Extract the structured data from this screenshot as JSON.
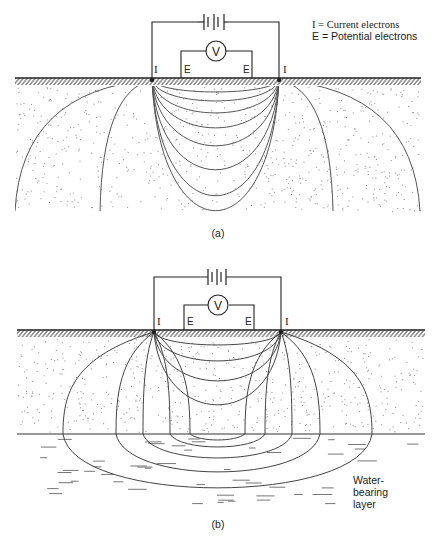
{
  "legend": {
    "current": "I = Current electrons",
    "potential": "E = Potential electrons"
  },
  "electrode_labels": {
    "current": "I",
    "potential": "E"
  },
  "voltmeter_label": "V",
  "panels": [
    {
      "id": "a",
      "caption": "(a)",
      "description": "Homogeneous ground: current flow lines between electrodes"
    },
    {
      "id": "b",
      "caption": "(b)",
      "description": "Current flow lines refracted at a water-bearing layer"
    }
  ],
  "water_layer_label": [
    "Water-",
    "bearing",
    "layer"
  ],
  "colors": {
    "ink": "#222222",
    "stipple": "#8a8a8a",
    "curve": "#555555"
  }
}
